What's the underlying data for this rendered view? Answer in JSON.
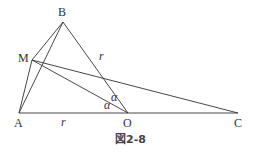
{
  "figure": {
    "caption": "図2-8",
    "line_color": "#333333"
  },
  "points": {
    "A": {
      "label": "A",
      "x": 19,
      "y": 113
    },
    "B": {
      "label": "B",
      "x": 63,
      "y": 22
    },
    "M": {
      "label": "M",
      "x": 32,
      "y": 60
    },
    "O": {
      "label": "O",
      "x": 128,
      "y": 113
    },
    "C": {
      "label": "C",
      "x": 238,
      "y": 113
    }
  },
  "segments": [
    {
      "from": "A",
      "to": "C"
    },
    {
      "from": "A",
      "to": "B"
    },
    {
      "from": "A",
      "to": "M"
    },
    {
      "from": "M",
      "to": "B"
    },
    {
      "from": "B",
      "to": "O"
    },
    {
      "from": "M",
      "to": "O"
    },
    {
      "from": "M",
      "to": "C"
    }
  ],
  "annotations": {
    "r_BO": "r",
    "r_AO": "r",
    "alpha_upper": "α",
    "alpha_lower": "α"
  }
}
